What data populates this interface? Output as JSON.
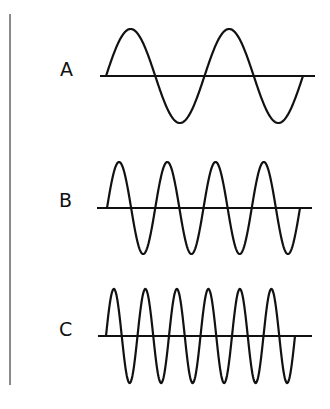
{
  "figure": {
    "stroke_color": "#111111",
    "margin_line_color": "#8a8a8a"
  },
  "waves": [
    {
      "label": "A",
      "cycles": 2,
      "axis_y": 76,
      "axis_x0": 100,
      "axis_x1": 315,
      "wave_x0": 106,
      "wave_x1": 303,
      "amplitude": 47,
      "label_x": 60,
      "label_y": 60
    },
    {
      "label": "B",
      "cycles": 4,
      "axis_y": 208,
      "axis_x0": 97,
      "axis_x1": 312,
      "wave_x0": 107,
      "wave_x1": 300,
      "amplitude": 46,
      "label_x": 59,
      "label_y": 191
    },
    {
      "label": "C",
      "cycles": 6,
      "axis_y": 336,
      "axis_x0": 98,
      "axis_x1": 312,
      "wave_x0": 106,
      "wave_x1": 295,
      "amplitude": 47,
      "label_x": 59,
      "label_y": 320
    }
  ]
}
